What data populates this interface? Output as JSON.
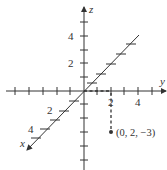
{
  "diagram": {
    "axes": {
      "x": {
        "name": "x",
        "tick_labels": [
          "2",
          "4"
        ]
      },
      "y": {
        "name": "y",
        "tick_labels": [
          "2",
          "4"
        ]
      },
      "z": {
        "name": "z",
        "tick_labels": [
          "4",
          "2"
        ]
      }
    },
    "point": {
      "coordinates": [
        0,
        2,
        -3
      ],
      "label": "(0, 2, −3)"
    },
    "colors": {
      "ink": "#333333",
      "background": "#ffffff"
    }
  }
}
